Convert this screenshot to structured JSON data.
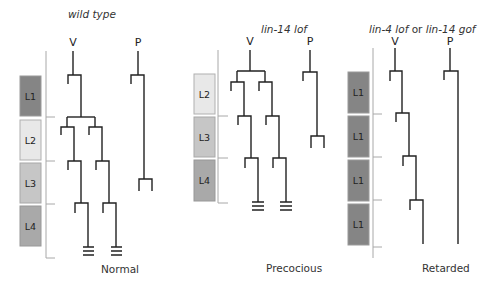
{
  "panels": [
    {
      "id": "wild-type",
      "title": "wild type",
      "caption": "Normal",
      "cell_labels": {
        "v": "V",
        "p": "P"
      },
      "stages": [
        {
          "label": "L1",
          "color": "#858585"
        },
        {
          "label": "L2",
          "color": "#e8e8e8"
        },
        {
          "label": "L3",
          "color": "#c6c6c6"
        },
        {
          "label": "L4",
          "color": "#a9a9a9"
        }
      ]
    },
    {
      "id": "lin-14-lof",
      "title": "lin-14 lof",
      "caption": "Precocious",
      "cell_labels": {
        "v": "V",
        "p": "P"
      },
      "stages": [
        {
          "label": "L2",
          "color": "#e8e8e8"
        },
        {
          "label": "L3",
          "color": "#c6c6c6"
        },
        {
          "label": "L4",
          "color": "#a9a9a9"
        }
      ]
    },
    {
      "id": "retarded",
      "title_parts": [
        "lin-4 lof",
        " or ",
        "lin-14 gof"
      ],
      "caption": "Retarded",
      "cell_labels": {
        "v": "V",
        "p": "P"
      },
      "stages": [
        {
          "label": "L1",
          "color": "#858585"
        },
        {
          "label": "L1",
          "color": "#858585"
        },
        {
          "label": "L1",
          "color": "#858585"
        },
        {
          "label": "L1",
          "color": "#858585"
        }
      ]
    }
  ]
}
